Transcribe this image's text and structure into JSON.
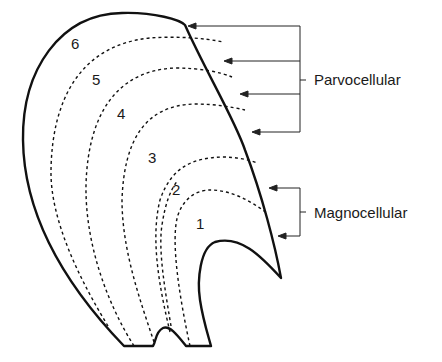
{
  "diagram": {
    "layers": [
      {
        "id": "1",
        "label": "1",
        "x": 196,
        "y": 190
      },
      {
        "id": "2",
        "label": "2",
        "x": 172,
        "y": 158
      },
      {
        "id": "3",
        "label": "3",
        "x": 147,
        "y": 120
      },
      {
        "id": "4",
        "label": "4",
        "x": 117,
        "y": 84
      },
      {
        "id": "5",
        "label": "5",
        "x": 91,
        "y": 71
      },
      {
        "id": "6",
        "label": "6",
        "x": 71,
        "y": 37
      }
    ],
    "groups": [
      {
        "name": "Parvocellular",
        "label": "Parvocellular",
        "layers": [
          "3",
          "4",
          "5",
          "6"
        ],
        "arrow_count": 4
      },
      {
        "name": "Magnocellular",
        "label": "Magnocellular",
        "layers": [
          "1",
          "2"
        ],
        "arrow_count": 2
      }
    ],
    "colors": {
      "stroke": "#111111",
      "background": "#ffffff"
    }
  }
}
